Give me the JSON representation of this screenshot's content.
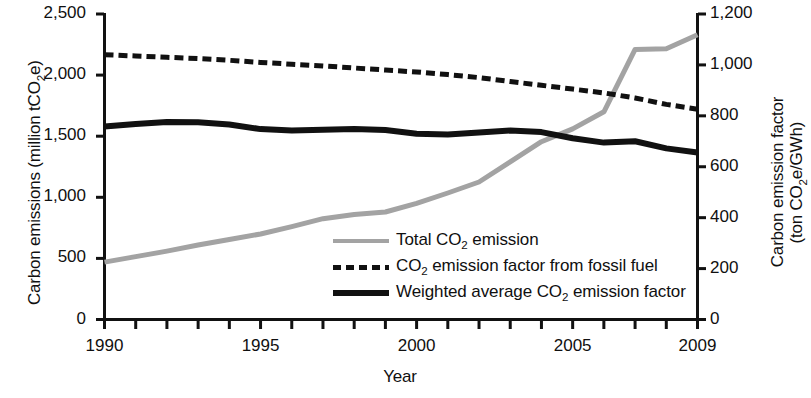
{
  "chart_data": {
    "type": "line",
    "title": "",
    "xlabel": "Year",
    "ylabel": "Carbon emissions (million tCO2e)",
    "ylabel_right_line1": "Carbon emission factor",
    "ylabel_right_line2": "(ton CO2e/GWh)",
    "xlim": [
      1990,
      2009
    ],
    "ylim": [
      0,
      2500
    ],
    "ylim_right": [
      0,
      1200
    ],
    "grid": false,
    "legend_position": "center-right-inside",
    "x": [
      1990,
      1991,
      1992,
      1993,
      1994,
      1995,
      1996,
      1997,
      1998,
      1999,
      2000,
      2001,
      2002,
      2003,
      2004,
      2005,
      2006,
      2007,
      2008,
      2009
    ],
    "xticks": [
      1990,
      1991,
      1992,
      1993,
      1994,
      1995,
      1996,
      1997,
      1998,
      1999,
      2000,
      2001,
      2002,
      2003,
      2004,
      2005,
      2006,
      2007,
      2008,
      2009
    ],
    "xtick_labels_shown": [
      "1990",
      "1995",
      "2000",
      "2005",
      "2009"
    ],
    "yticks_left": [
      0,
      500,
      1000,
      1500,
      2000,
      2500
    ],
    "ytick_labels_left": [
      "0",
      "500",
      "1,000",
      "1,500",
      "2,000",
      "2,500"
    ],
    "yticks_right": [
      0,
      200,
      400,
      600,
      800,
      1000,
      1200
    ],
    "ytick_labels_right": [
      "0",
      "200",
      "400",
      "600",
      "800",
      "1,000",
      "1,200"
    ],
    "series": [
      {
        "name": "Total CO2 emission",
        "label": "Total CO<sub>2</sub> emission",
        "axis": "left",
        "style": "solid",
        "color": "#a3a3a3",
        "width": 5,
        "unit": "million tCO2e",
        "values": [
          470,
          515,
          560,
          610,
          655,
          700,
          760,
          825,
          860,
          880,
          950,
          1035,
          1125,
          1290,
          1455,
          1560,
          1700,
          2210,
          2215,
          2330
        ]
      },
      {
        "name": "CO2 emission factor from fossil fuel",
        "label": "CO<sub>2</sub> emission factor from fossil fuel",
        "axis": "right",
        "style": "dashed",
        "color": "#111111",
        "width": 5,
        "unit": "ton CO2e/GWh",
        "values": [
          1040,
          1035,
          1030,
          1025,
          1018,
          1010,
          1003,
          996,
          988,
          980,
          972,
          962,
          950,
          935,
          920,
          905,
          890,
          870,
          845,
          826
        ]
      },
      {
        "name": "Weighted average CO2 emission factor",
        "label": "Weighted average CO<sub>2</sub> emission factor",
        "axis": "right",
        "style": "solid",
        "color": "#111111",
        "width": 6,
        "unit": "ton CO2e/GWh",
        "values": [
          758,
          768,
          776,
          775,
          766,
          748,
          742,
          745,
          748,
          744,
          730,
          727,
          734,
          742,
          736,
          712,
          695,
          700,
          672,
          656
        ]
      }
    ]
  },
  "axes": {
    "left_title": "Carbon emissions (million tCO",
    "left_title_sub": "2",
    "left_title_tail": "e)",
    "right_title_line1": "Carbon emission factor",
    "right_title_line2_head": "(ton CO",
    "right_title_line2_sub": "2",
    "right_title_line2_tail": "e/GWh)",
    "x_title": "Year"
  },
  "legend": {
    "items": [
      {
        "swatch": "gray-solid-line",
        "head": "Total CO",
        "sub": "2",
        "tail": " emission"
      },
      {
        "swatch": "black-dashed-line",
        "head": "CO",
        "sub": "2",
        "tail": " emission factor from fossil fuel"
      },
      {
        "swatch": "black-solid-line",
        "head": "Weighted average CO",
        "sub": "2",
        "tail": " emission factor"
      }
    ]
  },
  "colors": {
    "total_emission": "#a3a3a3",
    "fossil_factor": "#111111",
    "weighted_factor": "#111111",
    "axis": "#111111",
    "background": "#ffffff"
  }
}
